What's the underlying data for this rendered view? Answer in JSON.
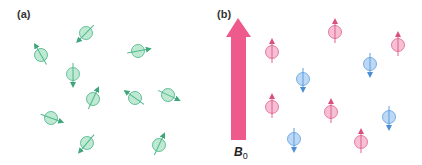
{
  "panels": {
    "a": {
      "label": "(a)"
    },
    "b": {
      "label": "(b)",
      "field_label": "B",
      "field_subscript": "0"
    }
  },
  "colors": {
    "random_fill": "#bfe9d3",
    "random_stroke": "#4fb88a",
    "up_fill": "#f6bfd3",
    "up_stroke": "#e0608f",
    "down_fill": "#bcd8f5",
    "down_stroke": "#5a9fe0",
    "field_arrow": "#ee5a8c"
  },
  "spins_a": [
    {
      "x": 86,
      "y": 33,
      "angle": 225
    },
    {
      "x": 41,
      "y": 55,
      "angle": 330
    },
    {
      "x": 138,
      "y": 51,
      "angle": 80
    },
    {
      "x": 73,
      "y": 74,
      "angle": 180
    },
    {
      "x": 93,
      "y": 99,
      "angle": 25
    },
    {
      "x": 135,
      "y": 98,
      "angle": 305
    },
    {
      "x": 168,
      "y": 95,
      "angle": 115
    },
    {
      "x": 51,
      "y": 118,
      "angle": 110
    },
    {
      "x": 87,
      "y": 143,
      "angle": 220
    },
    {
      "x": 159,
      "y": 145,
      "angle": 25
    }
  ],
  "spins_b": [
    {
      "x": 272,
      "y": 52,
      "dir": "up"
    },
    {
      "x": 335,
      "y": 32,
      "dir": "up"
    },
    {
      "x": 398,
      "y": 45,
      "dir": "up"
    },
    {
      "x": 370,
      "y": 64,
      "dir": "down"
    },
    {
      "x": 303,
      "y": 79,
      "dir": "down"
    },
    {
      "x": 272,
      "y": 107,
      "dir": "up"
    },
    {
      "x": 331,
      "y": 112,
      "dir": "up"
    },
    {
      "x": 389,
      "y": 117,
      "dir": "down"
    },
    {
      "x": 294,
      "y": 139,
      "dir": "down"
    },
    {
      "x": 361,
      "y": 142,
      "dir": "up"
    }
  ]
}
